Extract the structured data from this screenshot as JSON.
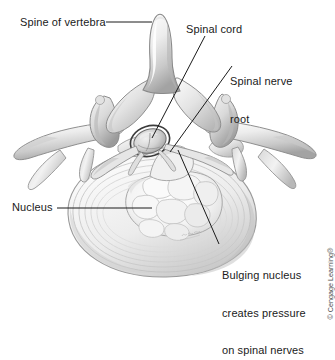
{
  "figure": {
    "background_color": "#ffffff",
    "line_color": "#1a1a1a",
    "ink_color": "#8a8a8a",
    "labels": {
      "spine_of_vertebra": "Spine of vertebra",
      "spinal_cord": "Spinal cord",
      "spinal_nerve_root_line1": "Spinal nerve",
      "spinal_nerve_root_line2": "root",
      "nucleus": "Nucleus",
      "bulging_line1": "Bulging nucleus",
      "bulging_line2": "creates pressure",
      "bulging_line3": "on spinal nerves"
    },
    "copyright": "© Cengage Learning®",
    "artist_signature": "M. Horns"
  }
}
